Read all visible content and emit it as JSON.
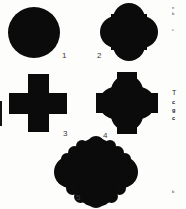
{
  "figure": {
    "kind": "geometric-shape-plate",
    "background_color": "#fdfdfc",
    "ink_color": "#0b0b0b",
    "label_color": "#3a3a3a",
    "shapes": [
      {
        "number": "1",
        "name": "circle",
        "description": "solid filled circle",
        "label_x": 62,
        "label_y": 52
      },
      {
        "number": "2",
        "name": "quatrefoil",
        "description": "four overlapping circles forming a clover",
        "label_x": 97,
        "label_y": 52
      },
      {
        "number": "3",
        "name": "greek-cross",
        "description": "equal-armed plus shape",
        "label_x": 63,
        "label_y": 130
      },
      {
        "number": "4",
        "name": "quatrefoil-cross",
        "description": "union of quatrefoil and greek cross",
        "label_x": 103,
        "label_y": 132
      },
      {
        "number": "5",
        "name": "multifoil-rosette",
        "description": "diamond-set rosette with scalloped lobes",
        "label_x": 76,
        "label_y": 194
      }
    ]
  },
  "margin": {
    "lines": [
      {
        "text": "e",
        "top": 5
      },
      {
        "text": "b",
        "top": 11
      },
      {
        "text": "c",
        "top": 27
      },
      {
        "text": "T",
        "top": 89,
        "style": "heading"
      },
      {
        "text": "c",
        "top": 98,
        "style": "bold"
      },
      {
        "text": "g",
        "top": 106,
        "style": "bold"
      },
      {
        "text": "c",
        "top": 114,
        "style": "bold"
      },
      {
        "text": "b",
        "top": 189
      }
    ]
  }
}
